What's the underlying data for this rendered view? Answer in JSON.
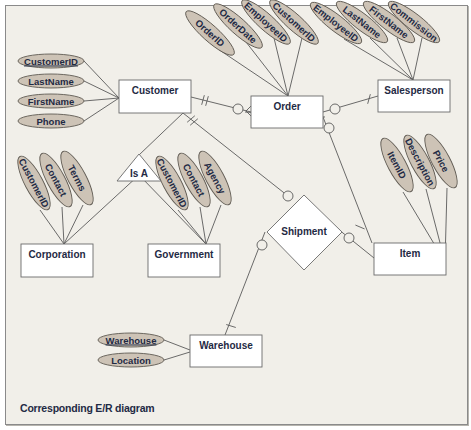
{
  "caption": "Corresponding E/R diagram",
  "colors": {
    "background": "#f1efe9",
    "attribute_fill": "#cdc3b6",
    "attribute_stroke": "#5f5a52",
    "entity_fill": "#ffffff",
    "line": "#5a5a5a",
    "text": "#1f2a44"
  },
  "entities": [
    {
      "id": "customer",
      "label": "Customer",
      "x": 119,
      "y": 80,
      "w": 72,
      "h": 33
    },
    {
      "id": "order",
      "label": "Order",
      "x": 251,
      "y": 96,
      "w": 72,
      "h": 32
    },
    {
      "id": "salesperson",
      "label": "Salesperson",
      "x": 378,
      "y": 80,
      "w": 72,
      "h": 32
    },
    {
      "id": "corporation",
      "label": "Corporation",
      "x": 21,
      "y": 244,
      "w": 72,
      "h": 33
    },
    {
      "id": "government",
      "label": "Government",
      "x": 148,
      "y": 244,
      "w": 72,
      "h": 33
    },
    {
      "id": "item",
      "label": "Item",
      "x": 374,
      "y": 243,
      "w": 72,
      "h": 32
    },
    {
      "id": "warehouse",
      "label": "Warehouse",
      "x": 190,
      "y": 335,
      "w": 72,
      "h": 32
    }
  ],
  "relationships": [
    {
      "id": "is-a",
      "label": "Is A",
      "shape": "triangle"
    },
    {
      "id": "shipment",
      "label": "Shipment",
      "shape": "diamond"
    }
  ],
  "attributes": {
    "customer": [
      "CustomerID",
      "LastName",
      "FirstName",
      "Phone"
    ],
    "order": [
      "OrderID",
      "OrderDate",
      "EmployeeID",
      "CustomerID"
    ],
    "salesperson": [
      "EmployeeID",
      "LastName",
      "FirstName",
      "Commission"
    ],
    "corporation": [
      "CustomerID",
      "Contact",
      "Terms"
    ],
    "government": [
      "CustomerID",
      "Contact",
      "Agency"
    ],
    "item": [
      "ItemID",
      "Description",
      "Price"
    ],
    "warehouse": [
      "Warehouse",
      "Location"
    ]
  },
  "key_attributes": [
    "customer.CustomerID",
    "warehouse.Warehouse"
  ]
}
